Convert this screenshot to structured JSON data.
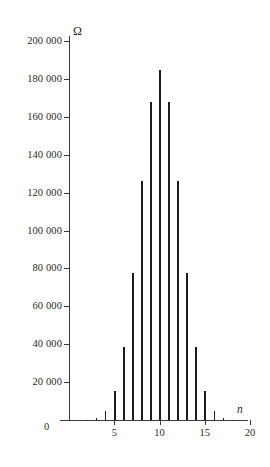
{
  "chart_data": {
    "type": "bar",
    "title": "",
    "subtitle": "",
    "xlabel": "n",
    "ylabel": "Ω",
    "categories": [
      0,
      1,
      2,
      3,
      4,
      5,
      6,
      7,
      8,
      9,
      10,
      11,
      12,
      13,
      14,
      15,
      16,
      17,
      18,
      19,
      20
    ],
    "values": [
      1,
      20,
      190,
      1140,
      4845,
      15504,
      38760,
      77520,
      125970,
      167960,
      184756,
      167960,
      125970,
      77520,
      38760,
      15504,
      4845,
      1140,
      190,
      20,
      1
    ],
    "xlim": [
      0,
      21
    ],
    "ylim": [
      0,
      205000
    ],
    "grid": false,
    "legend": null,
    "y_ticks": [
      0,
      20000,
      40000,
      60000,
      80000,
      100000,
      120000,
      140000,
      160000,
      180000,
      200000
    ],
    "y_tick_labels": [
      "0",
      "20 000",
      "40 000",
      "60 000",
      "80 000",
      "100 000",
      "120 000",
      "140 000",
      "160 000",
      "180 000",
      "200 000"
    ],
    "x_ticks": [
      5,
      10,
      15,
      20
    ],
    "x_tick_labels": [
      "5",
      "10",
      "15",
      "20"
    ],
    "origin_label": "0",
    "bar_color": "#1c1c1c",
    "axis_color": "#3a3a3a"
  }
}
